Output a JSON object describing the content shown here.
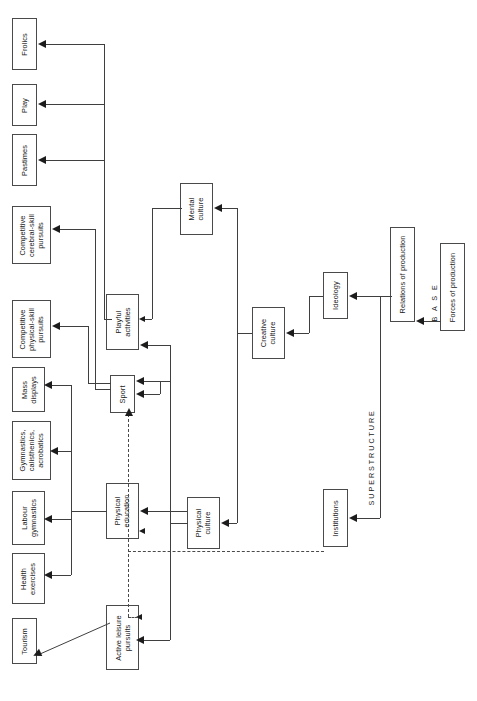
{
  "diagram": {
    "orientation": "rotated-90-ccw",
    "top_clipped_text": "",
    "band_labels": {
      "superstructure": "S U P E R S T R U C T U R E",
      "base": "B   A   S   E"
    },
    "nodes": [
      {
        "id": "frolics",
        "label": "Frolics"
      },
      {
        "id": "play",
        "label": "Play"
      },
      {
        "id": "pastimes",
        "label": "Pastimes"
      },
      {
        "id": "cerebral",
        "label": "Competitive\ncerebral-skill\npursuits"
      },
      {
        "id": "physskill",
        "label": "Competitive\nphysical-skill\npursuits"
      },
      {
        "id": "massdisplays",
        "label": "Mass\ndisplays"
      },
      {
        "id": "gymnastics",
        "label": "Gymnastics,\ncalisthenics,\nacrobatics"
      },
      {
        "id": "labourgym",
        "label": "Labour\ngymnastics"
      },
      {
        "id": "healthex",
        "label": "Health\nexercises"
      },
      {
        "id": "tourism",
        "label": "Tourism"
      },
      {
        "id": "playful",
        "label": "Playful\nactivities"
      },
      {
        "id": "sport",
        "label": "Sport"
      },
      {
        "id": "physed",
        "label": "Physical\neducation"
      },
      {
        "id": "activeleisure",
        "label": "Active leisure\npursuits"
      },
      {
        "id": "mentalculture",
        "label": "Mental\nculture"
      },
      {
        "id": "physculture",
        "label": "Physical\nculture"
      },
      {
        "id": "creativeculture",
        "label": "Creative\nculture"
      },
      {
        "id": "ideology",
        "label": "Ideology"
      },
      {
        "id": "institutions",
        "label": "Institutions"
      },
      {
        "id": "relations",
        "label": "Relations of production"
      },
      {
        "id": "forces",
        "label": "Forces of production"
      }
    ],
    "edges": [
      {
        "from": "playful",
        "to": "frolics",
        "style": "solid"
      },
      {
        "from": "playful",
        "to": "play",
        "style": "solid"
      },
      {
        "from": "playful",
        "to": "pastimes",
        "style": "solid"
      },
      {
        "from": "sport",
        "to": "cerebral",
        "style": "solid"
      },
      {
        "from": "sport",
        "to": "physskill",
        "style": "solid"
      },
      {
        "from": "physed",
        "to": "massdisplays",
        "style": "solid"
      },
      {
        "from": "physed",
        "to": "gymnastics",
        "style": "solid"
      },
      {
        "from": "physed",
        "to": "labourgym",
        "style": "solid"
      },
      {
        "from": "physed",
        "to": "healthex",
        "style": "solid"
      },
      {
        "from": "activeleisure",
        "to": "tourism",
        "style": "solid"
      },
      {
        "from": "mentalculture",
        "to": "playful",
        "style": "solid"
      },
      {
        "from": "physculture",
        "to": "playful",
        "style": "solid"
      },
      {
        "from": "physculture",
        "to": "sport",
        "style": "solid"
      },
      {
        "from": "physculture",
        "to": "physed",
        "style": "solid"
      },
      {
        "from": "physculture",
        "to": "activeleisure",
        "style": "solid"
      },
      {
        "from": "creativeculture",
        "to": "mentalculture",
        "style": "solid"
      },
      {
        "from": "creativeculture",
        "to": "physculture",
        "style": "solid"
      },
      {
        "from": "ideology",
        "to": "creativeculture",
        "style": "solid"
      },
      {
        "from": "relations",
        "to": "ideology",
        "style": "solid"
      },
      {
        "from": "relations",
        "to": "institutions",
        "style": "solid"
      },
      {
        "from": "forces",
        "to": "relations",
        "style": "solid"
      },
      {
        "from": "institutions",
        "to": "sport",
        "style": "dashed"
      },
      {
        "from": "institutions",
        "to": "physed",
        "style": "dashed"
      },
      {
        "from": "institutions",
        "to": "activeleisure",
        "style": "dashed"
      }
    ]
  },
  "colors": {
    "box_border": "#4a4a4a",
    "line": "#3f3f3f",
    "arrow": "#1c1c1c",
    "text": "#1a1a1a",
    "background": "#ffffff"
  }
}
